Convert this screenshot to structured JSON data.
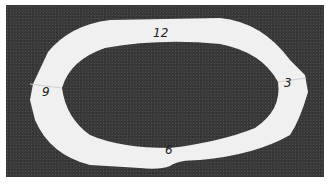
{
  "image": {
    "description": "Photograph of a white paper ring shaped like an oval with notches at left and right, on a dark textured background, labeled with clock positions",
    "colors": {
      "background": "#3a3a3a",
      "ring": "#f2f2f2",
      "border": "#ffffff"
    }
  },
  "labels": {
    "top": "12",
    "right": "3",
    "bottom": "6",
    "left": "9"
  }
}
